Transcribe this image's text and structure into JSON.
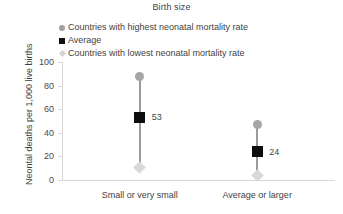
{
  "chart_data": {
    "type": "scatter",
    "title": "Birth size",
    "xlabel": "",
    "ylabel": "Neontal deaths per 1,000 live births",
    "categories": [
      "Small or very small",
      "Average or larger"
    ],
    "ylim": [
      0,
      100
    ],
    "yticks": [
      0,
      20,
      40,
      60,
      80,
      100
    ],
    "grid": false,
    "legend_position": "top-left",
    "series": [
      {
        "name": "Countries with highest neonatal mortality rate",
        "marker": "circle",
        "color": "#a6a6a6",
        "values": [
          88,
          47
        ]
      },
      {
        "name": "Average",
        "marker": "square",
        "color": "#0d0d0d",
        "values": [
          53,
          24
        ]
      },
      {
        "name": "Countries with lowest neonatal mortality rate",
        "marker": "diamond",
        "color": "#d9d9d9",
        "values": [
          11,
          4
        ]
      }
    ],
    "data_labels": [
      {
        "category": "Small or very small",
        "series": "Average",
        "text": "53"
      },
      {
        "category": "Average or larger",
        "series": "Average",
        "text": "24"
      }
    ]
  }
}
